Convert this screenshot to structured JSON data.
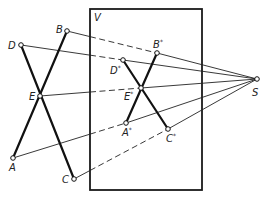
{
  "figure": {
    "type": "central-projection-construction",
    "projection_plane": {
      "label": "V",
      "rect": {
        "x": 90,
        "y": 9,
        "w": 112,
        "h": 181
      }
    },
    "center": {
      "label": "S",
      "x": 257,
      "y": 79,
      "lx": 252,
      "ly": 96
    },
    "object_points": [
      {
        "id": "B",
        "label": "B",
        "x": 67,
        "y": 31,
        "lx": 56,
        "ly": 33
      },
      {
        "id": "D",
        "label": "D",
        "x": 21,
        "y": 45,
        "lx": 8,
        "ly": 49
      },
      {
        "id": "E",
        "label": "E",
        "x": 40,
        "y": 96,
        "lx": 29,
        "ly": 100
      },
      {
        "id": "A",
        "label": "A",
        "x": 13,
        "y": 158,
        "lx": 9,
        "ly": 171
      },
      {
        "id": "C",
        "label": "C",
        "x": 74,
        "y": 179,
        "lx": 62,
        "ly": 183
      }
    ],
    "image_points": [
      {
        "id": "B*",
        "label": "B*",
        "x": 157,
        "y": 53,
        "lx": 153,
        "ly": 48
      },
      {
        "id": "D*",
        "label": "D*",
        "x": 123,
        "y": 60,
        "lx": 110,
        "ly": 74
      },
      {
        "id": "E*",
        "label": "E*",
        "x": 141,
        "y": 88,
        "lx": 124,
        "ly": 100
      },
      {
        "id": "A*",
        "label": "A*",
        "x": 126,
        "y": 123,
        "lx": 122,
        "ly": 136
      },
      {
        "id": "C*",
        "label": "C*",
        "x": 168,
        "y": 129,
        "lx": 166,
        "ly": 142
      }
    ],
    "object_segments": [
      [
        "D",
        "C"
      ],
      [
        "B",
        "A"
      ]
    ],
    "image_segments": [
      [
        "D*",
        "C*"
      ],
      [
        "B*",
        "A*"
      ]
    ],
    "rays": [
      {
        "from": "B",
        "via": "B*",
        "dashed_inside_plane": true
      },
      {
        "from": "D",
        "via": "D*",
        "dashed_inside_plane": true
      },
      {
        "from": "E",
        "via": "E*",
        "dashed_inside_plane": true
      },
      {
        "from": "A",
        "via": "A*",
        "dashed_inside_plane": true
      },
      {
        "from": "C",
        "via": "C*",
        "dashed_inside_plane": true
      }
    ]
  }
}
